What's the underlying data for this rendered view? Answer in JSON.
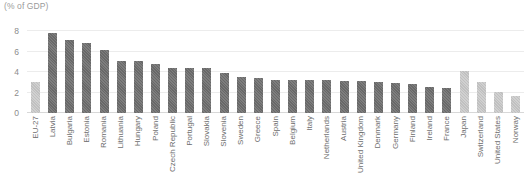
{
  "chart_data": {
    "type": "bar",
    "title": "",
    "ylabel": "(% of GDP)",
    "xlabel": "",
    "ylim": [
      0,
      8.6
    ],
    "yticks": [
      "0",
      "2",
      "4",
      "6",
      "8"
    ],
    "ytick_values": [
      0,
      2,
      4,
      6,
      8
    ],
    "grid": true,
    "legend": "none",
    "colors": {
      "bar": "#6f6f6f",
      "highlight_bar": "#c6c6c6",
      "gridline": "#ececec",
      "baseline": "#d8d8d8",
      "tick_text": "#6d6d6d",
      "axis_title_text": "#9a9a9a"
    },
    "categories": [
      "EU-27",
      "Latvia",
      "Bulgaria",
      "Estonia",
      "Romania",
      "Lithuania",
      "Hungary",
      "Poland",
      "Czech Republic",
      "Portugal",
      "Slovakia",
      "Slovenia",
      "Sweden",
      "Greece",
      "Spain",
      "Belgium",
      "Italy",
      "Netherlands",
      "Austria",
      "United Kingdom",
      "Denmark",
      "Germany",
      "Finland",
      "Ireland",
      "France",
      "Japan",
      "Switzerland",
      "United States",
      "Norway"
    ],
    "values": [
      3.0,
      7.8,
      7.1,
      6.8,
      6.2,
      5.1,
      5.1,
      4.8,
      4.4,
      4.4,
      4.4,
      3.9,
      3.5,
      3.4,
      3.2,
      3.2,
      3.2,
      3.2,
      3.1,
      3.1,
      3.0,
      2.9,
      2.8,
      2.5,
      2.4,
      4.1,
      3.0,
      2.1,
      1.7
    ],
    "highlight_indices": [
      0,
      25,
      26,
      27,
      28
    ]
  }
}
